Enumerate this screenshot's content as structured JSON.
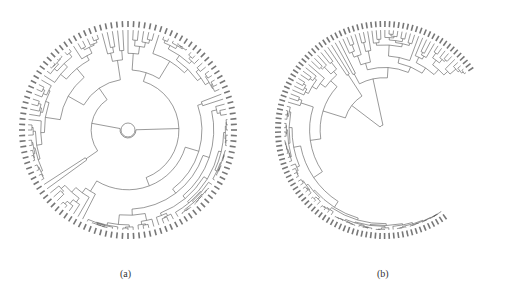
{
  "figure": {
    "panels": [
      {
        "id": "a",
        "caption": "(a)",
        "type": "circular-dendrogram",
        "center": [
          128,
          130
        ],
        "leaf_radius": 100,
        "leaf_count": 120,
        "arc_start_deg": 0,
        "arc_end_deg": 360,
        "leaf_labels_legible": false
      },
      {
        "id": "b",
        "caption": "(b)",
        "type": "circular-dendrogram",
        "center": [
          384,
          130
        ],
        "leaf_radius": 100,
        "leaf_count": 110,
        "arc_start_deg": -215,
        "arc_end_deg": 55,
        "leaf_labels_legible": false
      }
    ],
    "line_color": "#555555",
    "label_color": "#777777"
  }
}
